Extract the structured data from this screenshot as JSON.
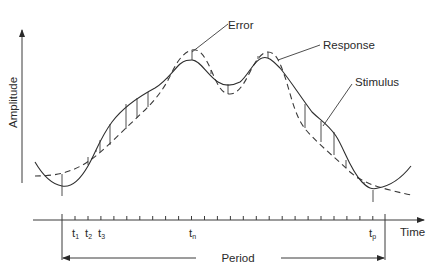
{
  "diagram": {
    "type": "signal-tracking-error",
    "y_axis": {
      "label": "Amplitude"
    },
    "x_axis": {
      "label": "Time"
    },
    "curves": [
      {
        "name": "Stimulus",
        "style": "solid"
      },
      {
        "name": "Response",
        "style": "dashed"
      }
    ],
    "annotations": {
      "error": "Error",
      "response": "Response",
      "stimulus": "Stimulus"
    },
    "time_ticks": {
      "t1": {
        "base": "t",
        "sub": "1"
      },
      "t2": {
        "base": "t",
        "sub": "2"
      },
      "t3": {
        "base": "t",
        "sub": "3"
      },
      "tn": {
        "base": "t",
        "sub": "n"
      },
      "tp": {
        "base": "t",
        "sub": "p"
      }
    },
    "period": {
      "label": "Period"
    }
  }
}
